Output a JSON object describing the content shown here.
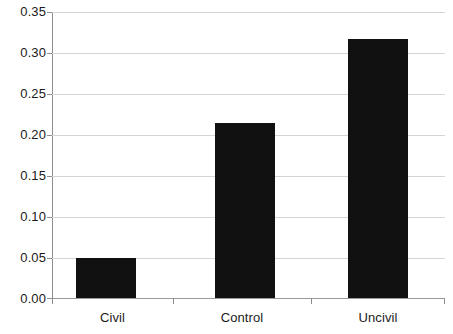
{
  "chart_data": {
    "type": "bar",
    "title": "",
    "subtitle": "",
    "xlabel": "",
    "ylabel": "",
    "categories": [
      "Civil",
      "Control",
      "Uncivil"
    ],
    "values": [
      0.049,
      0.214,
      0.317
    ],
    "series": [
      {
        "name": "",
        "values": [
          0.049,
          0.214,
          0.317
        ]
      }
    ],
    "ylim": [
      0.0,
      0.35
    ],
    "ytick_values": [
      0.0,
      0.05,
      0.1,
      0.15,
      0.2,
      0.25,
      0.3,
      0.35
    ],
    "ytick_labels": [
      "0.00",
      "0.05",
      "0.10",
      "0.15",
      "0.20",
      "0.25",
      "0.30",
      "0.35"
    ],
    "grid": "horizontal",
    "legend": "none",
    "annotations": [],
    "colors": {
      "bar": "#111111",
      "gridline": "#d4d4d4",
      "axis": "#8d8d8d",
      "text": "#1b1b1b",
      "background": "#ffffff"
    }
  }
}
